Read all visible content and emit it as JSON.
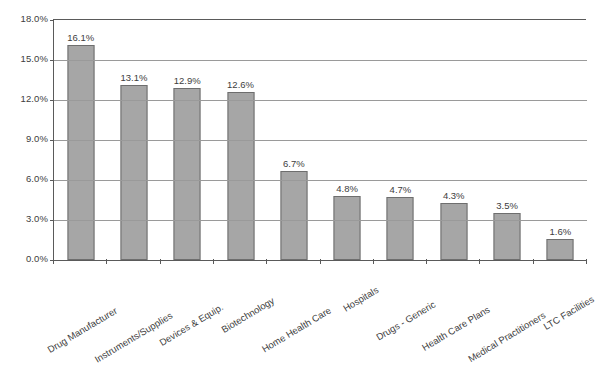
{
  "chart_data": {
    "type": "bar",
    "title": "",
    "subtitle": "",
    "xlabel": "",
    "ylabel": "",
    "ylim": [
      0,
      18
    ],
    "ytick_labels": [
      "0.0%",
      "3.0%",
      "6.0%",
      "9.0%",
      "12.0%",
      "15.0%",
      "18.0%"
    ],
    "ytick_values": [
      0,
      3,
      6,
      9,
      12,
      15,
      18
    ],
    "grid": "horizontal",
    "legend": "none",
    "value_label_suffix": "%",
    "categories": [
      "Drug Manufacturer",
      "Instruments/Supplies",
      "Devices & Equip.",
      "Biotechnology",
      "Home Health Care",
      "Hospitals",
      "Drugs - Generic",
      "Health Care Plans",
      "Medical Practitioners",
      "LTC Facilities"
    ],
    "values": [
      16.1,
      13.1,
      12.9,
      12.6,
      6.7,
      4.8,
      4.7,
      4.3,
      3.5,
      1.6
    ],
    "value_labels": [
      "16.1%",
      "13.1%",
      "12.9%",
      "12.6%",
      "6.7%",
      "4.8%",
      "4.7%",
      "4.3%",
      "3.5%",
      "1.6%"
    ],
    "series": [
      {
        "name": "",
        "color": "#a6a6a6",
        "border_color": "#6e6e6e",
        "values": [
          16.1,
          13.1,
          12.9,
          12.6,
          6.7,
          4.8,
          4.7,
          4.3,
          3.5,
          1.6
        ]
      }
    ],
    "colors": {
      "bar_fill": "#a6a6a6",
      "bar_border": "#6e6e6e",
      "gridline": "#9a9a9a",
      "axis": "#5a5a5a",
      "text": "#3d3d3d",
      "background": "#ffffff"
    }
  }
}
